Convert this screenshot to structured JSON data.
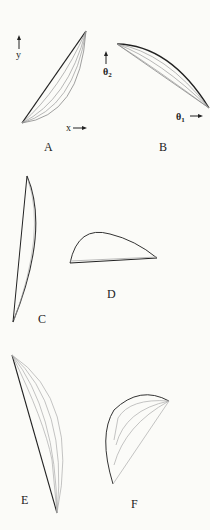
{
  "figure": {
    "panels": [
      {
        "id": "A",
        "label": "A",
        "x_axis": "x",
        "y_axis": "y"
      },
      {
        "id": "B",
        "label": "B",
        "x_axis": "θ1",
        "y_axis": "θ2",
        "x_axis_base": "θ",
        "x_axis_sub": "1",
        "y_axis_base": "θ",
        "y_axis_sub": "2"
      },
      {
        "id": "C",
        "label": "C"
      },
      {
        "id": "D",
        "label": "D"
      },
      {
        "id": "E",
        "label": "E"
      },
      {
        "id": "F",
        "label": "F"
      }
    ],
    "colors": {
      "background": "#fbfbf8",
      "outline": "#222222",
      "inner_curves": "#9a9a9a"
    }
  }
}
